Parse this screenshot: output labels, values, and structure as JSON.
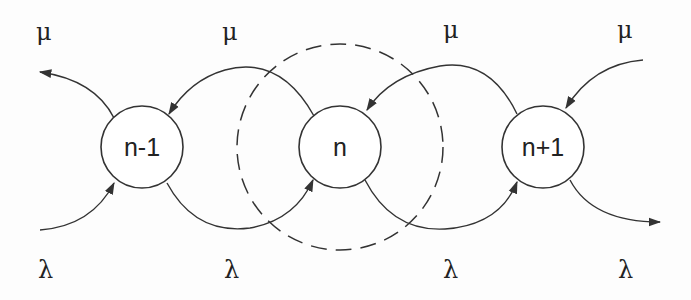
{
  "diagram": {
    "type": "birth-death-chain",
    "nodes": [
      {
        "id": "n-1",
        "label": "n-1"
      },
      {
        "id": "n",
        "label": "n"
      },
      {
        "id": "n+1",
        "label": "n+1"
      }
    ],
    "boundary": {
      "around": "n",
      "style": "dashed-circle"
    },
    "rates": {
      "death": "μ",
      "birth": "λ"
    },
    "labels": {
      "mu_1": "μ",
      "mu_2": "μ",
      "mu_3": "μ",
      "mu_4": "μ",
      "lambda_1": "λ",
      "lambda_2": "λ",
      "lambda_3": "λ",
      "lambda_4": "λ"
    },
    "edges": [
      {
        "from": "n-1",
        "to": "left-out",
        "label": "μ"
      },
      {
        "from": "left-in",
        "to": "n-1",
        "label": "λ"
      },
      {
        "from": "n",
        "to": "n-1",
        "label": "μ"
      },
      {
        "from": "n-1",
        "to": "n",
        "label": "λ"
      },
      {
        "from": "n+1",
        "to": "n",
        "label": "μ"
      },
      {
        "from": "n",
        "to": "n+1",
        "label": "λ"
      },
      {
        "from": "right-in",
        "to": "n+1",
        "label": "μ"
      },
      {
        "from": "n+1",
        "to": "right-out",
        "label": "λ"
      }
    ]
  }
}
